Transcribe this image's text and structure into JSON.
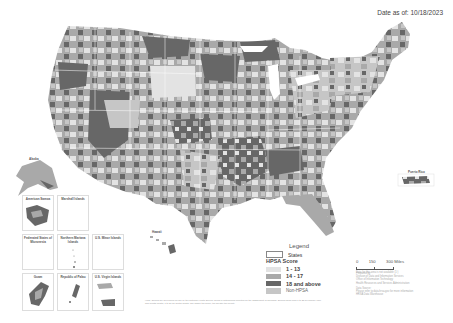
{
  "header": {
    "date_label": "Date as of: 10/18/2023"
  },
  "colors": {
    "score_1_13": "#e3e3e3",
    "score_14_17": "#a9a9a9",
    "score_18_above": "#676767",
    "non_hpsa": "#c6c6c6",
    "state_border": "#ffffff",
    "background": "#ffffff"
  },
  "legend": {
    "title": "Legend",
    "states_label": "States",
    "score_heading": "HPSA Score",
    "items": [
      {
        "label": "1 - 13",
        "color": "#e3e3e3"
      },
      {
        "label": "14 - 17",
        "color": "#a9a9a9"
      },
      {
        "label": "18 and above",
        "color": "#676767"
      },
      {
        "label": "Non-HPSA",
        "color": "#c6c6c6"
      }
    ]
  },
  "scale": {
    "ticks": [
      "0",
      "150",
      "300 Miles"
    ],
    "note": "Data for this area is not available (1:)"
  },
  "credits": {
    "prepared_by": "Prepared by:",
    "line1": "Division of Data and Information Services",
    "line2": "Office of Information Technology",
    "line3": "Health Resources and Services Administration",
    "data_source": "Data Source:",
    "line4": "Please refer to data.hrsa.gov for more information",
    "line5": "HRSA Data Warehouse"
  },
  "fineprint": "HPSA Scores are developed for use by the National Health Service Corps in determining priorities for the assignment of clinicians. Scores range from 1 to 25 for primary care and mental health, 1 to 26 for dental health. The higher the score, the greater the priority.",
  "place_labels": {
    "alaska": "Alaska",
    "hawaii": "Hawaii",
    "puerto_rico": "Puerto Rico"
  },
  "insets": [
    {
      "label": "American Samoa"
    },
    {
      "label": "Marshall Islands"
    },
    {
      "label": "Federated States of Micronesia"
    },
    {
      "label": "Northern Mariana Islands"
    },
    {
      "label": "U.S. Minor Islands"
    },
    {
      "label": "Guam"
    },
    {
      "label": "Republic of Palau"
    },
    {
      "label": "U.S. Virgin Islands"
    }
  ]
}
